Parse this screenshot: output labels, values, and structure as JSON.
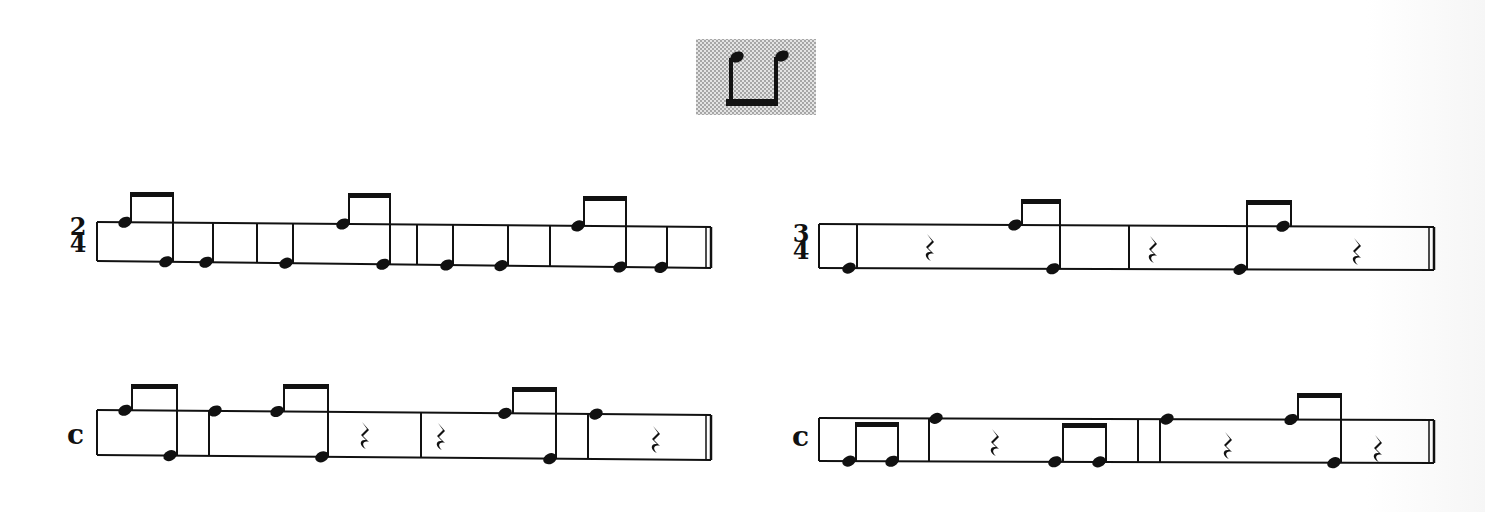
{
  "header_icon": {
    "name": "eighth-note-pair-beamed-below",
    "x": 696,
    "y": 39,
    "w": 120,
    "h": 76,
    "bg": "#cfcfcf",
    "notes": [
      {
        "x": 737,
        "y": 57
      },
      {
        "x": 782,
        "y": 56
      }
    ],
    "beam": {
      "x1": 728,
      "x2": 778,
      "y": 99
    }
  },
  "colors": {
    "ink": "#111111",
    "halftone": "#c8c8c8"
  },
  "exercises": [
    {
      "id": "ex-2-4",
      "time_signature": {
        "type": "numeric",
        "top": "2",
        "bottom": "4",
        "x": 67,
        "y": 218
      },
      "staff": {
        "x1": 97,
        "x2": 711,
        "top_y1": 222,
        "top_y2": 227,
        "bot_y1": 261,
        "bot_y2": 268
      },
      "barlines": [
        257,
        417,
        550
      ],
      "final_bar": 706,
      "notes": [
        {
          "x": 125,
          "line": "top",
          "stem": "up",
          "stem_x": 131
        },
        {
          "x": 166,
          "line": "bottom",
          "stem": "up",
          "stem_x": 173
        },
        {
          "x": 206,
          "line": "bottom",
          "stem": "up",
          "stem_x": 213
        },
        {
          "x": 286,
          "line": "bottom",
          "stem": "up",
          "stem_x": 293
        },
        {
          "x": 343,
          "line": "top",
          "stem": "up",
          "stem_x": 349
        },
        {
          "x": 383,
          "line": "bottom",
          "stem": "up",
          "stem_x": 390
        },
        {
          "x": 447,
          "line": "bottom",
          "stem": "up",
          "stem_x": 453
        },
        {
          "x": 501,
          "line": "bottom",
          "stem": "up",
          "stem_x": 508
        },
        {
          "x": 578,
          "line": "top",
          "stem": "up",
          "stem_x": 584
        },
        {
          "x": 620,
          "line": "bottom",
          "stem": "up",
          "stem_x": 626
        },
        {
          "x": 661,
          "line": "bottom",
          "stem": "up",
          "stem_x": 667
        }
      ],
      "beams": [
        {
          "x1": 131,
          "x2": 173,
          "y": 193
        },
        {
          "x1": 349,
          "x2": 390,
          "y": 194
        },
        {
          "x1": 584,
          "x2": 626,
          "y": 197
        }
      ],
      "rests": []
    },
    {
      "id": "ex-3-4",
      "time_signature": {
        "type": "numeric",
        "top": "3",
        "bottom": "4",
        "x": 790,
        "y": 225
      },
      "staff": {
        "x1": 819,
        "x2": 1434,
        "top_y1": 224,
        "top_y2": 227,
        "bot_y1": 268,
        "bot_y2": 270
      },
      "barlines": [
        1129
      ],
      "final_bar": 1429,
      "notes": [
        {
          "x": 849,
          "line": "bottom",
          "stem": "up",
          "stem_x": 857
        },
        {
          "x": 1015,
          "line": "top",
          "stem": "up",
          "stem_x": 1022
        },
        {
          "x": 1053,
          "line": "bottom",
          "stem": "up",
          "stem_x": 1060
        },
        {
          "x": 1240,
          "line": "bottom",
          "stem": "up",
          "stem_x": 1247
        },
        {
          "x": 1283,
          "line": "top",
          "stem": "up",
          "stem_x": 1291
        }
      ],
      "beams": [
        {
          "x1": 1022,
          "x2": 1060,
          "y": 200
        },
        {
          "x1": 1247,
          "x2": 1291,
          "y": 201
        }
      ],
      "rests": [
        {
          "x": 930,
          "y": 248
        },
        {
          "x": 1153,
          "y": 250
        },
        {
          "x": 1357,
          "y": 252
        }
      ]
    },
    {
      "id": "ex-c-left",
      "time_signature": {
        "type": "common",
        "symbol": "c",
        "x": 67,
        "y": 448
      },
      "staff": {
        "x1": 97,
        "x2": 711,
        "top_y1": 410,
        "top_y2": 415,
        "bot_y1": 455,
        "bot_y2": 460
      },
      "barlines": [
        209,
        421,
        588
      ],
      "final_bar": 706,
      "notes": [
        {
          "x": 125,
          "line": "top",
          "stem": "up",
          "stem_x": 132
        },
        {
          "x": 170,
          "line": "bottom",
          "stem": "up",
          "stem_x": 177
        },
        {
          "x": 215,
          "line": "top",
          "stem": "none",
          "stem_x": 209
        },
        {
          "x": 277,
          "line": "top",
          "stem": "up",
          "stem_x": 284
        },
        {
          "x": 322,
          "line": "bottom",
          "stem": "up",
          "stem_x": 328
        },
        {
          "x": 505,
          "line": "top",
          "stem": "up",
          "stem_x": 513
        },
        {
          "x": 550,
          "line": "bottom",
          "stem": "up",
          "stem_x": 556
        },
        {
          "x": 596,
          "line": "top",
          "stem": "none",
          "stem_x": 588
        }
      ],
      "beams": [
        {
          "x1": 132,
          "x2": 177,
          "y": 385
        },
        {
          "x1": 284,
          "x2": 328,
          "y": 385
        },
        {
          "x1": 513,
          "x2": 556,
          "y": 388
        }
      ],
      "rests": [
        {
          "x": 365,
          "y": 436
        },
        {
          "x": 441,
          "y": 437
        },
        {
          "x": 656,
          "y": 440
        }
      ]
    },
    {
      "id": "ex-c-right",
      "time_signature": {
        "type": "common",
        "symbol": "c",
        "x": 792,
        "y": 450
      },
      "staff": {
        "x1": 819,
        "x2": 1434,
        "top_y1": 418,
        "top_y2": 420,
        "bot_y1": 461,
        "bot_y2": 463
      },
      "barlines": [
        929,
        1138,
        1160
      ],
      "final_bar": 1429,
      "notes": [
        {
          "x": 849,
          "line": "bottom",
          "stem": "up",
          "stem_x": 856
        },
        {
          "x": 892,
          "line": "bottom",
          "stem": "up",
          "stem_x": 898
        },
        {
          "x": 936,
          "line": "top",
          "stem": "none",
          "stem_x": 929
        },
        {
          "x": 1055,
          "line": "bottom",
          "stem": "up",
          "stem_x": 1063
        },
        {
          "x": 1099,
          "line": "bottom",
          "stem": "up",
          "stem_x": 1106
        },
        {
          "x": 1167,
          "line": "top",
          "stem": "none",
          "stem_x": 1160
        },
        {
          "x": 1291,
          "line": "top",
          "stem": "up",
          "stem_x": 1298
        },
        {
          "x": 1334,
          "line": "bottom",
          "stem": "up",
          "stem_x": 1341
        }
      ],
      "beams": [
        {
          "x1": 856,
          "x2": 898,
          "y": 423
        },
        {
          "x1": 1063,
          "x2": 1106,
          "y": 424
        },
        {
          "x1": 1298,
          "x2": 1341,
          "y": 394
        }
      ],
      "rests": [
        {
          "x": 995,
          "y": 443
        },
        {
          "x": 1228,
          "y": 446
        },
        {
          "x": 1378,
          "y": 449
        }
      ]
    }
  ]
}
